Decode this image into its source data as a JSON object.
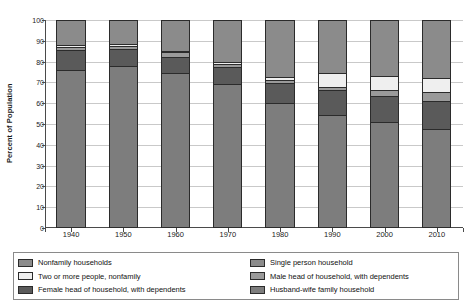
{
  "chart_data": {
    "type": "bar",
    "subtype": "stacked-bar-100-percent",
    "title": "",
    "subtitle": "",
    "xlabel": "",
    "ylabel": "Percent of Population",
    "categories": [
      "1940",
      "1950",
      "1960",
      "1970",
      "1980",
      "1990",
      "2000",
      "2010"
    ],
    "ylim": [
      0,
      100
    ],
    "yticks": [
      0,
      10,
      20,
      30,
      40,
      50,
      60,
      70,
      80,
      90,
      100
    ],
    "ytick_labels": [
      "0",
      "10",
      "20",
      "30",
      "40",
      "50",
      "60",
      "70",
      "80",
      "90",
      "100"
    ],
    "grid": true,
    "grid_axis": "y",
    "legend_position": "bottom",
    "stack_order_bottom_to_top": [
      "Husband-wife family household",
      "Female head of household, with dependents",
      "Male head of household, with dependents",
      "Two or more people, nonfamily",
      "Single person household"
    ],
    "series": [
      {
        "name": "Husband-wife family household",
        "color": "#7d7d7d",
        "values": [
          76,
          78,
          74.5,
          69,
          60,
          54.5,
          51,
          47.5
        ]
      },
      {
        "name": "Female head of household, with dependents",
        "color": "#5a5a5a",
        "values": [
          9.5,
          8,
          7.5,
          8.5,
          9.5,
          12,
          12.5,
          13.5
        ]
      },
      {
        "name": "Male head of household, with dependents",
        "color": "#9a9a9a",
        "values": [
          1.5,
          1.5,
          2.5,
          1.5,
          1.5,
          1.5,
          3,
          4.5
        ]
      },
      {
        "name": "Two or more people, nonfamily",
        "color": "#efefef",
        "values": [
          1,
          1,
          0.5,
          1,
          1.5,
          6.5,
          6.5,
          6.5
        ]
      },
      {
        "name": "Single person household",
        "color": "#8b8b8b",
        "values": [
          12,
          11.5,
          15,
          20,
          27.5,
          25.5,
          27,
          28
        ]
      }
    ],
    "legend_entries": [
      {
        "label": "Nonfamily households",
        "color": "#8b8b8b",
        "is_group_header": true
      },
      {
        "label": "Single person household",
        "color": "#8b8b8b",
        "is_group_header": false
      },
      {
        "label": "Two or more people, nonfamily",
        "color": "#efefef",
        "is_group_header": false
      },
      {
        "label": "Male head of household, with dependents",
        "color": "#9a9a9a",
        "is_group_header": false
      },
      {
        "label": "Female head of household, with dependents",
        "color": "#5a5a5a",
        "is_group_header": false
      },
      {
        "label": "Husband-wife family household",
        "color": "#7d7d7d",
        "is_group_header": false
      }
    ]
  },
  "axis": {
    "ylabel": "Percent of Population",
    "ytick_labels": [
      "100",
      "90",
      "80",
      "70",
      "60",
      "50",
      "40",
      "30",
      "20",
      "10",
      "0"
    ],
    "xtick_labels": [
      "1940",
      "1950",
      "1960",
      "1970",
      "1980",
      "1990",
      "2000",
      "2010"
    ]
  },
  "legend": {
    "col1": [
      "Nonfamily households",
      "Two or more people, nonfamily",
      "Female head of household, with dependents"
    ],
    "col2": [
      "Single person household",
      "Male head of household, with dependents",
      "Husband-wife family household"
    ]
  },
  "colors": {
    "husband_wife": "#7d7d7d",
    "female_head": "#5a5a5a",
    "male_head": "#9a9a9a",
    "two_or_more_nonfamily": "#efefef",
    "single_person": "#8b8b8b",
    "nonfamily_group": "#8b8b8b",
    "axis": "#4a4a4a",
    "grid": "#c9c9c9",
    "outline": "#2b2b2b"
  }
}
